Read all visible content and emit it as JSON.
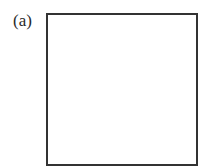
{
  "figure": {
    "label": "(a)",
    "shape": "square",
    "stroke_color": "#333333",
    "fill_color": "#ffffff"
  }
}
